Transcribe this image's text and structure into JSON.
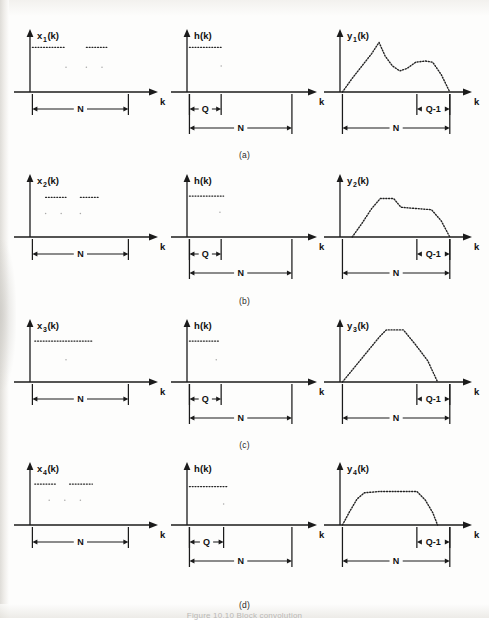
{
  "figure": {
    "caption": "Figure 10.10  Block convolution",
    "row_labels": [
      "(a)",
      "(b)",
      "(c)",
      "(d)"
    ],
    "axis_x_label": "k",
    "dimension_labels": {
      "N": "N",
      "Q": "Q",
      "Q_minus_1": "Q-1"
    },
    "accent_color": "#1b1b1b",
    "background_color": "#fdfdfc"
  },
  "chart_data": {
    "type": "line",
    "xlabel": "k",
    "ylabel": "",
    "grid": false,
    "legend": "none",
    "panels": [
      {
        "row": "(a)",
        "row_label": "(a)",
        "cells": [
          {
            "column": "input",
            "ylabel": "x",
            "ylabel_sub": "1",
            "ylabel_suffix": "(k)",
            "ylabel_full": "x1(k)",
            "xlabel": "k",
            "series_type": "dotted-samples",
            "segments": [
              {
                "x_start": 0.02,
                "x_end": 0.3,
                "y": 0.72
              },
              {
                "x_start": 0.47,
                "x_end": 0.64,
                "y": 0.72
              }
            ],
            "sparse_points": [
              {
                "x": 0.3,
                "y": 0.4
              },
              {
                "x": 0.47,
                "y": 0.4
              },
              {
                "x": 0.6,
                "y": 0.4
              }
            ],
            "dimensions": [
              {
                "label": "N",
                "x_start": 0.02,
                "x_end": 0.82,
                "level": 1
              }
            ]
          },
          {
            "column": "impulse",
            "ylabel": "h",
            "ylabel_sub": "",
            "ylabel_suffix": "(k)",
            "ylabel_full": "h(k)",
            "xlabel": "k",
            "series_type": "dotted-samples",
            "segments": [
              {
                "x_start": 0.02,
                "x_end": 0.28,
                "y": 0.72
              }
            ],
            "sparse_points": [
              {
                "x": 0.28,
                "y": 0.42
              }
            ],
            "dimensions": [
              {
                "label": "Q",
                "x_start": 0.02,
                "x_end": 0.28,
                "level": 1
              },
              {
                "label": "N",
                "x_start": 0.02,
                "x_end": 0.86,
                "level": 2
              }
            ]
          },
          {
            "column": "output",
            "ylabel": "y",
            "ylabel_sub": "1",
            "ylabel_suffix": "(k)",
            "ylabel_full": "y1(k)",
            "xlabel": "k",
            "series_type": "dotted-curve",
            "points": [
              {
                "x": 0.02,
                "y": 0.0
              },
              {
                "x": 0.1,
                "y": 0.22
              },
              {
                "x": 0.18,
                "y": 0.42
              },
              {
                "x": 0.26,
                "y": 0.62
              },
              {
                "x": 0.32,
                "y": 0.8
              },
              {
                "x": 0.37,
                "y": 0.58
              },
              {
                "x": 0.43,
                "y": 0.42
              },
              {
                "x": 0.49,
                "y": 0.34
              },
              {
                "x": 0.55,
                "y": 0.38
              },
              {
                "x": 0.62,
                "y": 0.48
              },
              {
                "x": 0.7,
                "y": 0.5
              },
              {
                "x": 0.76,
                "y": 0.48
              },
              {
                "x": 0.83,
                "y": 0.28
              },
              {
                "x": 0.9,
                "y": 0.0
              }
            ],
            "dimensions": [
              {
                "label": "Q-1",
                "x_start": 0.63,
                "x_end": 0.9,
                "level": 1
              },
              {
                "label": "N",
                "x_start": 0.02,
                "x_end": 0.9,
                "level": 2
              }
            ]
          }
        ]
      },
      {
        "row": "(b)",
        "row_label": "(b)",
        "cells": [
          {
            "column": "input",
            "ylabel": "x",
            "ylabel_sub": "2",
            "ylabel_suffix": "(k)",
            "ylabel_full": "x2(k)",
            "xlabel": "k",
            "series_type": "dotted-samples",
            "segments": [
              {
                "x_start": 0.13,
                "x_end": 0.3,
                "y": 0.64
              },
              {
                "x_start": 0.42,
                "x_end": 0.58,
                "y": 0.64
              }
            ],
            "sparse_points": [
              {
                "x": 0.13,
                "y": 0.38
              },
              {
                "x": 0.26,
                "y": 0.38
              },
              {
                "x": 0.42,
                "y": 0.38
              }
            ],
            "dimensions": [
              {
                "label": "N",
                "x_start": 0.02,
                "x_end": 0.82,
                "level": 1
              }
            ]
          },
          {
            "column": "impulse",
            "ylabel": "h",
            "ylabel_sub": "",
            "ylabel_suffix": "(k)",
            "ylabel_full": "h(k)",
            "xlabel": "k",
            "series_type": "dotted-samples",
            "segments": [
              {
                "x_start": 0.02,
                "x_end": 0.3,
                "y": 0.66
              }
            ],
            "sparse_points": [
              {
                "x": 0.27,
                "y": 0.4
              }
            ],
            "dimensions": [
              {
                "label": "Q",
                "x_start": 0.02,
                "x_end": 0.28,
                "level": 1
              },
              {
                "label": "N",
                "x_start": 0.02,
                "x_end": 0.86,
                "level": 2
              }
            ]
          },
          {
            "column": "output",
            "ylabel": "y",
            "ylabel_sub": "2",
            "ylabel_suffix": "(k)",
            "ylabel_full": "y2(k)",
            "xlabel": "k",
            "series_type": "dotted-curve",
            "points": [
              {
                "x": 0.1,
                "y": 0.0
              },
              {
                "x": 0.18,
                "y": 0.22
              },
              {
                "x": 0.26,
                "y": 0.46
              },
              {
                "x": 0.33,
                "y": 0.62
              },
              {
                "x": 0.44,
                "y": 0.62
              },
              {
                "x": 0.5,
                "y": 0.48
              },
              {
                "x": 0.62,
                "y": 0.46
              },
              {
                "x": 0.75,
                "y": 0.44
              },
              {
                "x": 0.83,
                "y": 0.26
              },
              {
                "x": 0.9,
                "y": 0.0
              }
            ],
            "dimensions": [
              {
                "label": "Q-1",
                "x_start": 0.63,
                "x_end": 0.9,
                "level": 1
              },
              {
                "label": "N",
                "x_start": 0.02,
                "x_end": 0.9,
                "level": 2
              }
            ]
          }
        ]
      },
      {
        "row": "(c)",
        "row_label": "(c)",
        "cells": [
          {
            "column": "input",
            "ylabel": "x",
            "ylabel_sub": "3",
            "ylabel_suffix": "(k)",
            "ylabel_full": "x3(k)",
            "xlabel": "k",
            "series_type": "dotted-samples",
            "segments": [
              {
                "x_start": 0.04,
                "x_end": 0.52,
                "y": 0.66
              }
            ],
            "sparse_points": [
              {
                "x": 0.3,
                "y": 0.36
              }
            ],
            "dimensions": [
              {
                "label": "N",
                "x_start": 0.02,
                "x_end": 0.82,
                "level": 1
              }
            ]
          },
          {
            "column": "impulse",
            "ylabel": "h",
            "ylabel_sub": "",
            "ylabel_suffix": "(k)",
            "ylabel_full": "h(k)",
            "xlabel": "k",
            "series_type": "dotted-samples",
            "segments": [
              {
                "x_start": 0.02,
                "x_end": 0.26,
                "y": 0.66
              }
            ],
            "sparse_points": [
              {
                "x": 0.24,
                "y": 0.36
              }
            ],
            "dimensions": [
              {
                "label": "Q",
                "x_start": 0.02,
                "x_end": 0.28,
                "level": 1
              },
              {
                "label": "N",
                "x_start": 0.02,
                "x_end": 0.86,
                "level": 2
              }
            ]
          },
          {
            "column": "output",
            "ylabel": "y",
            "ylabel_sub": "3",
            "ylabel_suffix": "(k)",
            "ylabel_full": "y3(k)",
            "xlabel": "k",
            "series_type": "dotted-curve",
            "points": [
              {
                "x": 0.02,
                "y": 0.0
              },
              {
                "x": 0.12,
                "y": 0.24
              },
              {
                "x": 0.22,
                "y": 0.48
              },
              {
                "x": 0.32,
                "y": 0.72
              },
              {
                "x": 0.38,
                "y": 0.84
              },
              {
                "x": 0.52,
                "y": 0.84
              },
              {
                "x": 0.62,
                "y": 0.6
              },
              {
                "x": 0.72,
                "y": 0.34
              },
              {
                "x": 0.8,
                "y": 0.0
              }
            ],
            "dimensions": [
              {
                "label": "Q-1",
                "x_start": 0.63,
                "x_end": 0.9,
                "level": 1
              },
              {
                "label": "N",
                "x_start": 0.02,
                "x_end": 0.9,
                "level": 2
              }
            ]
          }
        ]
      },
      {
        "row": "(d)",
        "row_label": "(d)",
        "cells": [
          {
            "column": "input",
            "ylabel": "x",
            "ylabel_sub": "4",
            "ylabel_suffix": "(k)",
            "ylabel_full": "x4(k)",
            "xlabel": "k",
            "series_type": "dotted-samples",
            "segments": [
              {
                "x_start": 0.04,
                "x_end": 0.22,
                "y": 0.66
              },
              {
                "x_start": 0.33,
                "x_end": 0.52,
                "y": 0.66
              }
            ],
            "sparse_points": [
              {
                "x": 0.16,
                "y": 0.4
              },
              {
                "x": 0.29,
                "y": 0.4
              },
              {
                "x": 0.42,
                "y": 0.4
              }
            ],
            "dimensions": [
              {
                "label": "N",
                "x_start": 0.02,
                "x_end": 0.82,
                "level": 1
              }
            ]
          },
          {
            "column": "impulse",
            "ylabel": "h",
            "ylabel_sub": "",
            "ylabel_suffix": "(k)",
            "ylabel_full": "h(k)",
            "xlabel": "k",
            "series_type": "dotted-samples",
            "segments": [
              {
                "x_start": 0.02,
                "x_end": 0.34,
                "y": 0.62
              }
            ],
            "sparse_points": [
              {
                "x": 0.3,
                "y": 0.34
              }
            ],
            "dimensions": [
              {
                "label": "Q",
                "x_start": 0.02,
                "x_end": 0.3,
                "level": 1
              },
              {
                "label": "N",
                "x_start": 0.02,
                "x_end": 0.86,
                "level": 2
              }
            ]
          },
          {
            "column": "output",
            "ylabel": "y",
            "ylabel_sub": "4",
            "ylabel_suffix": "(k)",
            "ylabel_full": "y4(k)",
            "xlabel": "k",
            "series_type": "dotted-curve",
            "points": [
              {
                "x": 0.02,
                "y": 0.0
              },
              {
                "x": 0.08,
                "y": 0.22
              },
              {
                "x": 0.14,
                "y": 0.42
              },
              {
                "x": 0.2,
                "y": 0.52
              },
              {
                "x": 0.32,
                "y": 0.54
              },
              {
                "x": 0.5,
                "y": 0.54
              },
              {
                "x": 0.63,
                "y": 0.54
              },
              {
                "x": 0.7,
                "y": 0.4
              },
              {
                "x": 0.76,
                "y": 0.2
              },
              {
                "x": 0.8,
                "y": 0.0
              }
            ],
            "dimensions": [
              {
                "label": "Q-1",
                "x_start": 0.63,
                "x_end": 0.9,
                "level": 1
              },
              {
                "label": "N",
                "x_start": 0.02,
                "x_end": 0.9,
                "level": 2
              }
            ]
          }
        ]
      }
    ]
  }
}
